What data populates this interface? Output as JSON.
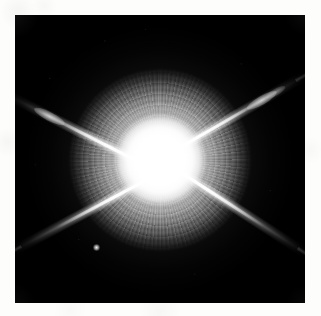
{
  "page": {
    "background_color": "#fdfdfc",
    "width": 321,
    "height": 316
  },
  "figure": {
    "kind": "astronomical-image",
    "caption": "",
    "frame": {
      "background_color": "#000000",
      "left": 15,
      "top": 15,
      "width": 290,
      "height": 288
    }
  },
  "star": {
    "label": "",
    "center_x": 160,
    "center_y": 160,
    "core_color": "#ffffff",
    "core_radius_px": 40,
    "halo_radius_px": 90,
    "halo_description": "speckled radial point-spread-function halo",
    "saturated": true
  },
  "diffraction_spikes": [
    {
      "name": "spike-northwest",
      "angle_deg": 207,
      "length_px": 170,
      "has_knot": false
    },
    {
      "name": "spike-northeast",
      "angle_deg": -30,
      "length_px": 170,
      "has_knot": true
    },
    {
      "name": "spike-southeast",
      "angle_deg": 33,
      "length_px": 170,
      "has_knot": false
    },
    {
      "name": "spike-southwest",
      "angle_deg": 152,
      "length_px": 170,
      "has_knot": false
    }
  ],
  "companion": {
    "name": "faint-point-source",
    "x": 96,
    "y": 247,
    "brightness": "faint"
  },
  "colors": {
    "sky": "#000000",
    "star": "#ffffff",
    "paper": "#fdfdfc"
  }
}
